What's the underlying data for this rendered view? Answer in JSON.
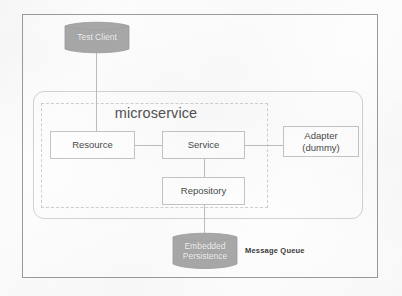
{
  "diagram": {
    "title": "microservice",
    "containers": {
      "rounded_container_name": "service-container",
      "dashed_boundary_label": "microservice"
    },
    "components": [
      {
        "id": "resource",
        "label": "Resource"
      },
      {
        "id": "service",
        "label": "Service"
      },
      {
        "id": "adapter",
        "label_line1": "Adapter",
        "label_line2": "(dummy)"
      },
      {
        "id": "repository",
        "label": "Repository"
      }
    ],
    "datastores": [
      {
        "id": "test-client",
        "label": "Test Client",
        "shape": "cylinder"
      },
      {
        "id": "embedded-persistence",
        "label_line1": "Embedded",
        "label_line2": "Persistence",
        "shape": "cylinder"
      }
    ],
    "annotations": [
      {
        "id": "message-queue",
        "label": "Message Queue"
      }
    ],
    "colors": {
      "frame_border": "#9a9a9a",
      "box_border": "#c4c4c4",
      "dashed_border": "#cfcfcf",
      "connector": "#bdbdbd",
      "cylinder_fill": "#a8a8a8",
      "cylinder_text": "#f2f2f2",
      "background": "#fdfdfd",
      "text": "#4a4a4a"
    }
  }
}
